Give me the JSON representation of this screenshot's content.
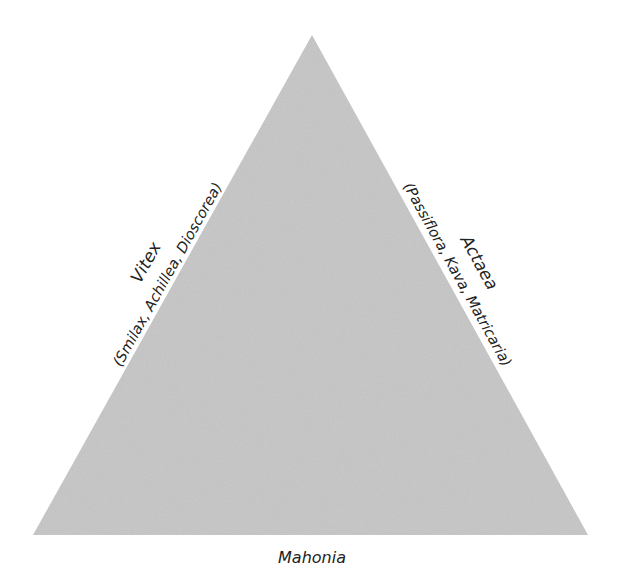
{
  "diagram": {
    "shape": "triangle",
    "fill_color": "#c6c6c6",
    "background_color": "#ffffff",
    "text_color": "#222222",
    "vertices": {
      "apex": [
        312,
        35
      ],
      "bottom_left": [
        33,
        535
      ],
      "bottom_right": [
        588,
        535
      ]
    },
    "left_side": {
      "title": "Vitex",
      "subtitle": "(Smilax, Achillea, Dioscorea)"
    },
    "right_side": {
      "title": "Actaea",
      "subtitle": "(Passiflora, Kava, Matricaria)"
    },
    "bottom_side": {
      "title": "Mahonia"
    }
  }
}
